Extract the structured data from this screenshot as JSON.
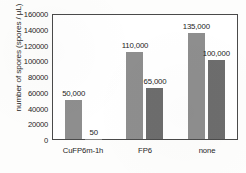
{
  "chart_data": {
    "type": "bar",
    "title": "",
    "xlabel": "",
    "ylabel": "number of spores (spores / µL)",
    "ylim": [
      0,
      160000
    ],
    "ytick_labels": [
      "160000",
      "140000",
      "120000",
      "100000",
      "80000",
      "60000",
      "40000",
      "20000",
      "0"
    ],
    "ytick_values": [
      160000,
      140000,
      120000,
      100000,
      80000,
      60000,
      40000,
      20000,
      0
    ],
    "grid": false,
    "legend": "none",
    "categories": [
      "CuFP6m-1h",
      "FP6",
      "none"
    ],
    "series": [
      {
        "name": "series-1",
        "color": "#8e8e8e",
        "values": [
          50000,
          110000,
          135000
        ],
        "labels": [
          "50,000",
          "110,000",
          "135,000"
        ]
      },
      {
        "name": "series-2",
        "color": "#6d6d6d",
        "values": [
          50,
          65000,
          100000
        ],
        "labels": [
          "50",
          "65,000",
          "100,000"
        ]
      }
    ]
  }
}
